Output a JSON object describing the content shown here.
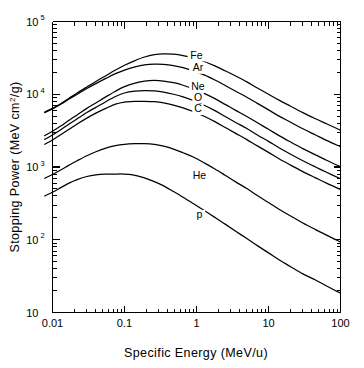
{
  "chart_data": {
    "type": "line",
    "title": "",
    "xlabel": "Specific Energy  (MeV/u)",
    "ylabel": "Stopping Power (MeV cm2/g)",
    "ylabel_parts": {
      "prefix": "Stopping Power (MeV cm",
      "exponent": "2",
      "suffix": "/g)"
    },
    "xscale": "log",
    "yscale": "log",
    "xlim": [
      0.01,
      100
    ],
    "ylim": [
      10,
      100000
    ],
    "grid": false,
    "legend_position": "inline-labels",
    "x_ticks": [
      {
        "value": 0.01,
        "label": "0.01"
      },
      {
        "value": 0.1,
        "label": "0.1"
      },
      {
        "value": 1,
        "label": "1"
      },
      {
        "value": 10,
        "label": "10"
      },
      {
        "value": 100,
        "label": "100"
      }
    ],
    "y_ticks": [
      {
        "value": 100000,
        "mantissa": "10",
        "exponent": "5"
      },
      {
        "value": 10000,
        "mantissa": "10",
        "exponent": "4"
      },
      {
        "value": 1000,
        "mantissa": "10",
        "exponent": "3"
      },
      {
        "value": 100,
        "mantissa": "10",
        "exponent": "2"
      },
      {
        "value": 10,
        "mantissa": "10",
        "exponent": ""
      }
    ],
    "series": [
      {
        "name": "Fe",
        "label": "Fe",
        "label_at": {
          "x": 1.0,
          "y": 31000
        },
        "peak": {
          "x": 0.35,
          "y": 36000
        },
        "points": [
          [
            0.0078,
            5700
          ],
          [
            0.01,
            6400
          ],
          [
            0.013,
            7400
          ],
          [
            0.017,
            8800
          ],
          [
            0.022,
            10400
          ],
          [
            0.03,
            12600
          ],
          [
            0.04,
            15000
          ],
          [
            0.055,
            18000
          ],
          [
            0.075,
            21500
          ],
          [
            0.1,
            25000
          ],
          [
            0.14,
            29000
          ],
          [
            0.19,
            32500
          ],
          [
            0.26,
            35000
          ],
          [
            0.35,
            36000
          ],
          [
            0.48,
            35500
          ],
          [
            0.65,
            34000
          ],
          [
            0.9,
            31500
          ],
          [
            1.3,
            28000
          ],
          [
            1.8,
            24500
          ],
          [
            2.5,
            21000
          ],
          [
            3.5,
            17800
          ],
          [
            5.0,
            14800
          ],
          [
            7.0,
            12200
          ],
          [
            10,
            10000
          ],
          [
            14,
            8300
          ],
          [
            20,
            6900
          ],
          [
            30,
            5600
          ],
          [
            45,
            4600
          ],
          [
            65,
            3900
          ],
          [
            100,
            3200
          ]
        ]
      },
      {
        "name": "Ar",
        "label": "Ar",
        "label_at": {
          "x": 1.05,
          "y": 21000
        },
        "peak": {
          "x": 0.3,
          "y": 26000
        },
        "points": [
          [
            0.0078,
            5600
          ],
          [
            0.01,
            6300
          ],
          [
            0.013,
            7300
          ],
          [
            0.017,
            8600
          ],
          [
            0.022,
            10000
          ],
          [
            0.03,
            12000
          ],
          [
            0.04,
            14000
          ],
          [
            0.055,
            16500
          ],
          [
            0.075,
            19200
          ],
          [
            0.1,
            21500
          ],
          [
            0.14,
            23800
          ],
          [
            0.19,
            25400
          ],
          [
            0.26,
            26000
          ],
          [
            0.35,
            25800
          ],
          [
            0.48,
            24800
          ],
          [
            0.65,
            23200
          ],
          [
            0.9,
            21000
          ],
          [
            1.3,
            18300
          ],
          [
            1.8,
            15700
          ],
          [
            2.5,
            13200
          ],
          [
            3.5,
            11000
          ],
          [
            5.0,
            9100
          ],
          [
            7.0,
            7500
          ],
          [
            10,
            6100
          ],
          [
            14,
            5000
          ],
          [
            20,
            4150
          ],
          [
            30,
            3350
          ],
          [
            45,
            2750
          ],
          [
            65,
            2300
          ],
          [
            100,
            1900
          ]
        ]
      },
      {
        "name": "Ne",
        "label": "Ne",
        "label_at": {
          "x": 1.05,
          "y": 11500
        },
        "peak": {
          "x": 0.25,
          "y": 15500
        },
        "points": [
          [
            0.0078,
            2700
          ],
          [
            0.01,
            3100
          ],
          [
            0.013,
            3650
          ],
          [
            0.017,
            4400
          ],
          [
            0.022,
            5200
          ],
          [
            0.03,
            6400
          ],
          [
            0.04,
            7600
          ],
          [
            0.055,
            9200
          ],
          [
            0.075,
            11000
          ],
          [
            0.1,
            12700
          ],
          [
            0.14,
            14200
          ],
          [
            0.19,
            15200
          ],
          [
            0.26,
            15500
          ],
          [
            0.35,
            15200
          ],
          [
            0.48,
            14400
          ],
          [
            0.65,
            13300
          ],
          [
            0.9,
            11900
          ],
          [
            1.3,
            10200
          ],
          [
            1.8,
            8700
          ],
          [
            2.5,
            7250
          ],
          [
            3.5,
            6000
          ],
          [
            5.0,
            4950
          ],
          [
            7.0,
            4050
          ],
          [
            10,
            3300
          ],
          [
            14,
            2700
          ],
          [
            20,
            2220
          ],
          [
            30,
            1790
          ],
          [
            45,
            1470
          ],
          [
            65,
            1230
          ],
          [
            100,
            1010
          ]
        ]
      },
      {
        "name": "O",
        "label": "O",
        "label_at": {
          "x": 1.05,
          "y": 8200
        },
        "peak": {
          "x": 0.23,
          "y": 11200
        },
        "points": [
          [
            0.0078,
            2400
          ],
          [
            0.01,
            2750
          ],
          [
            0.013,
            3250
          ],
          [
            0.017,
            3900
          ],
          [
            0.022,
            4600
          ],
          [
            0.03,
            5600
          ],
          [
            0.04,
            6600
          ],
          [
            0.055,
            7900
          ],
          [
            0.075,
            9300
          ],
          [
            0.1,
            10400
          ],
          [
            0.14,
            11000
          ],
          [
            0.19,
            11200
          ],
          [
            0.26,
            11100
          ],
          [
            0.35,
            10700
          ],
          [
            0.48,
            10000
          ],
          [
            0.65,
            9200
          ],
          [
            0.9,
            8200
          ],
          [
            1.3,
            7000
          ],
          [
            1.8,
            5950
          ],
          [
            2.5,
            4950
          ],
          [
            3.5,
            4100
          ],
          [
            5.0,
            3380
          ],
          [
            7.0,
            2760
          ],
          [
            10,
            2250
          ],
          [
            14,
            1840
          ],
          [
            20,
            1510
          ],
          [
            30,
            1220
          ],
          [
            45,
            1000
          ],
          [
            65,
            840
          ],
          [
            100,
            690
          ]
        ]
      },
      {
        "name": "C",
        "label": "C",
        "label_at": {
          "x": 1.05,
          "y": 5700
        },
        "peak": {
          "x": 0.22,
          "y": 8000
        },
        "points": [
          [
            0.0078,
            2050
          ],
          [
            0.01,
            2350
          ],
          [
            0.013,
            2780
          ],
          [
            0.017,
            3300
          ],
          [
            0.022,
            3900
          ],
          [
            0.03,
            4700
          ],
          [
            0.04,
            5500
          ],
          [
            0.055,
            6400
          ],
          [
            0.075,
            7300
          ],
          [
            0.1,
            7800
          ],
          [
            0.14,
            7980
          ],
          [
            0.19,
            8000
          ],
          [
            0.26,
            7900
          ],
          [
            0.35,
            7600
          ],
          [
            0.48,
            7100
          ],
          [
            0.65,
            6500
          ],
          [
            0.9,
            5800
          ],
          [
            1.3,
            4950
          ],
          [
            1.8,
            4200
          ],
          [
            2.5,
            3500
          ],
          [
            3.5,
            2900
          ],
          [
            5.0,
            2380
          ],
          [
            7.0,
            1950
          ],
          [
            10,
            1590
          ],
          [
            14,
            1300
          ],
          [
            20,
            1070
          ],
          [
            30,
            865
          ],
          [
            45,
            710
          ],
          [
            65,
            595
          ],
          [
            100,
            490
          ]
        ]
      },
      {
        "name": "He",
        "label": "He",
        "label_at": {
          "x": 1.1,
          "y": 680
        },
        "peak": {
          "x": 0.19,
          "y": 2100
        },
        "points": [
          [
            0.0078,
            700
          ],
          [
            0.01,
            790
          ],
          [
            0.013,
            910
          ],
          [
            0.017,
            1060
          ],
          [
            0.022,
            1220
          ],
          [
            0.03,
            1430
          ],
          [
            0.04,
            1620
          ],
          [
            0.055,
            1820
          ],
          [
            0.075,
            1970
          ],
          [
            0.1,
            2050
          ],
          [
            0.14,
            2090
          ],
          [
            0.19,
            2100
          ],
          [
            0.26,
            2050
          ],
          [
            0.35,
            1930
          ],
          [
            0.48,
            1760
          ],
          [
            0.65,
            1570
          ],
          [
            0.9,
            1370
          ],
          [
            1.3,
            1130
          ],
          [
            1.8,
            940
          ],
          [
            2.5,
            770
          ],
          [
            3.5,
            625
          ],
          [
            5.0,
            505
          ],
          [
            7.0,
            405
          ],
          [
            10,
            325
          ],
          [
            14,
            263
          ],
          [
            20,
            214
          ],
          [
            30,
            170
          ],
          [
            45,
            138
          ],
          [
            65,
            115
          ],
          [
            100,
            93
          ]
        ]
      },
      {
        "name": "p",
        "label": "p",
        "label_at": {
          "x": 1.1,
          "y": 200
        },
        "peak": {
          "x": 0.095,
          "y": 800
        },
        "points": [
          [
            0.0078,
            400
          ],
          [
            0.01,
            450
          ],
          [
            0.013,
            520
          ],
          [
            0.017,
            600
          ],
          [
            0.022,
            670
          ],
          [
            0.03,
            740
          ],
          [
            0.04,
            780
          ],
          [
            0.055,
            798
          ],
          [
            0.075,
            800
          ],
          [
            0.095,
            800
          ],
          [
            0.13,
            780
          ],
          [
            0.18,
            720
          ],
          [
            0.25,
            640
          ],
          [
            0.35,
            550
          ],
          [
            0.48,
            460
          ],
          [
            0.65,
            385
          ],
          [
            0.9,
            315
          ],
          [
            1.3,
            250
          ],
          [
            1.8,
            203
          ],
          [
            2.5,
            164
          ],
          [
            3.5,
            131
          ],
          [
            5.0,
            104
          ],
          [
            7.0,
            83
          ],
          [
            10,
            66
          ],
          [
            14,
            53
          ],
          [
            20,
            43
          ],
          [
            30,
            34
          ],
          [
            45,
            28
          ],
          [
            65,
            23
          ],
          [
            100,
            18.5
          ]
        ]
      }
    ]
  },
  "figure": {
    "background_color": "#ffffff",
    "line_color": "#000000"
  }
}
